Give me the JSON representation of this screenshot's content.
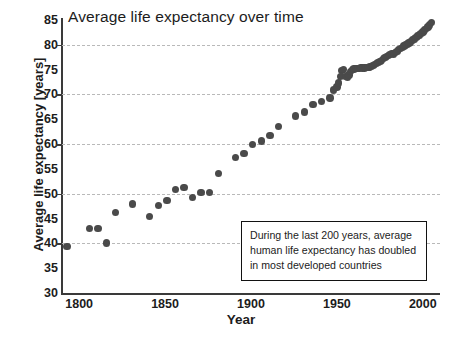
{
  "chart_data": {
    "type": "scatter",
    "title": "Average life expectancy over time",
    "xlabel": "Year",
    "ylabel": "Average life expectancy [years]",
    "xlim": [
      1790,
      2010
    ],
    "ylim": [
      30,
      85
    ],
    "xticks": [
      1800,
      1850,
      1900,
      1950,
      2000
    ],
    "yticks": [
      30,
      35,
      40,
      45,
      50,
      55,
      60,
      65,
      70,
      75,
      80,
      85
    ],
    "gridlines_y": [
      40,
      50,
      60,
      70,
      80
    ],
    "grid": "horizontal-dashed",
    "legend": "none",
    "marker_color": "#4a4a4a",
    "marker_shape": "circle",
    "annotations": [
      {
        "text": "During the last 200 years, average human life expectancy has doubled in most developed countries",
        "line1": "During the last 200 years, average",
        "line2": "human life expectancy has doubled",
        "line3": "in most developed countries"
      }
    ],
    "x": [
      1793,
      1806,
      1811,
      1816,
      1821,
      1831,
      1841,
      1846,
      1851,
      1856,
      1861,
      1866,
      1871,
      1876,
      1881,
      1891,
      1896,
      1901,
      1906,
      1911,
      1916,
      1926,
      1931,
      1936,
      1941,
      1946,
      1948,
      1950,
      1951,
      1952,
      1953,
      1954,
      1955,
      1956,
      1957,
      1958,
      1959,
      1960,
      1961,
      1962,
      1963,
      1964,
      1965,
      1966,
      1967,
      1968,
      1969,
      1970,
      1971,
      1972,
      1973,
      1974,
      1975,
      1976,
      1977,
      1978,
      1979,
      1980,
      1981,
      1982,
      1983,
      1984,
      1985,
      1986,
      1987,
      1988,
      1989,
      1990,
      1991,
      1992,
      1993,
      1994,
      1995,
      1996,
      1997,
      1998,
      1999,
      2000,
      2001,
      2002,
      2003,
      2004,
      2005
    ],
    "y": [
      39.4,
      43.0,
      43.0,
      40.1,
      46.2,
      47.9,
      45.4,
      47.6,
      48.6,
      50.9,
      51.3,
      49.3,
      50.3,
      50.3,
      54.1,
      57.3,
      58.1,
      59.9,
      60.6,
      61.7,
      63.6,
      65.7,
      66.5,
      68.0,
      68.6,
      69.3,
      70.9,
      71.5,
      72.3,
      73.6,
      74.8,
      75.0,
      73.6,
      73.5,
      73.9,
      74.6,
      75.0,
      75.1,
      75.2,
      75.2,
      75.2,
      75.4,
      75.3,
      75.3,
      75.4,
      75.4,
      75.5,
      75.6,
      75.8,
      76.0,
      76.2,
      76.5,
      76.7,
      76.9,
      77.2,
      77.4,
      77.6,
      77.8,
      78.0,
      78.2,
      78.0,
      78.4,
      78.6,
      79.0,
      79.2,
      79.4,
      79.8,
      80.0,
      80.2,
      80.4,
      80.6,
      81.0,
      81.2,
      81.5,
      81.8,
      82.0,
      82.3,
      82.6,
      83.0,
      83.3,
      83.6,
      84.0,
      84.5
    ]
  }
}
